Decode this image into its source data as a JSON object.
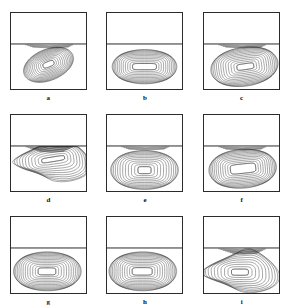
{
  "figure": {
    "type": "contour-panel-grid",
    "rows": 3,
    "columns": 3,
    "background_color": "#ffffff",
    "frame_color": "#2b2b2b",
    "contour_color": "#3a3a3a",
    "divider_fraction": 0.41
  },
  "chart_data": {
    "type": "contour",
    "title": "",
    "xlabel": "",
    "ylabel": "",
    "grid": false,
    "legend": null,
    "panel_geometry": {
      "frame": [
        0,
        0,
        1,
        1
      ],
      "divider_y": 0.41,
      "contour_region": [
        0,
        0.41,
        1,
        1
      ]
    },
    "panels": [
      {
        "label": "a",
        "description": "tilted elongated vortex, dense nested contours, core offset right-of-centre",
        "core": {
          "cx": 0.5,
          "cy": 0.67,
          "rx": 0.075,
          "ry": 0.035,
          "rotation": -22
        },
        "levels": 13,
        "outer": {
          "rx": 0.34,
          "ry": 0.2,
          "rotation": -22
        },
        "style": "tilted-ellipse"
      },
      {
        "label": "b",
        "description": "broad horizontal vortex filling lower cell, rounded-rectangle contours",
        "core": {
          "cx": 0.5,
          "cy": 0.7,
          "rx": 0.155,
          "ry": 0.04,
          "rotation": 0
        },
        "levels": 12,
        "outer": {
          "rx": 0.42,
          "ry": 0.22,
          "rotation": 0
        },
        "style": "rounded-rect"
      },
      {
        "label": "c",
        "description": "vortex with secondary roll along upper divider, contours skewed right",
        "core": {
          "cx": 0.55,
          "cy": 0.7,
          "rx": 0.11,
          "ry": 0.038,
          "rotation": -8
        },
        "levels": 13,
        "outer": {
          "rx": 0.44,
          "ry": 0.25,
          "rotation": -8
        },
        "style": "rounded-rect",
        "secondary": true
      },
      {
        "label": "d",
        "description": "complex multi-cell pattern, S-shaped wavy contours, dark shear band under divider",
        "core": {
          "cx": 0.56,
          "cy": 0.58,
          "rx": 0.15,
          "ry": 0.03,
          "rotation": -9
        },
        "levels": 11,
        "outer": {
          "rx": 0.44,
          "ry": 0.26,
          "rotation": 0
        },
        "style": "wavy"
      },
      {
        "label": "e",
        "description": "symmetric rectangular vortex, small round core near centre",
        "core": {
          "cx": 0.5,
          "cy": 0.72,
          "rx": 0.085,
          "ry": 0.045,
          "rotation": 0
        },
        "levels": 12,
        "outer": {
          "rx": 0.44,
          "ry": 0.25,
          "rotation": 0
        },
        "style": "rounded-rect"
      },
      {
        "label": "f",
        "description": "large open core, contours packed near left and bottom walls",
        "core": {
          "cx": 0.52,
          "cy": 0.7,
          "rx": 0.165,
          "ry": 0.06,
          "rotation": -6
        },
        "levels": 12,
        "outer": {
          "rx": 0.44,
          "ry": 0.25,
          "rotation": -4
        },
        "style": "rounded-rect"
      },
      {
        "label": "g",
        "description": "broad elliptical vortex, evenly spaced nested contours",
        "core": {
          "cx": 0.48,
          "cy": 0.71,
          "rx": 0.115,
          "ry": 0.045,
          "rotation": 0
        },
        "levels": 13,
        "outer": {
          "rx": 0.44,
          "ry": 0.25,
          "rotation": 0
        },
        "style": "rounded-rect"
      },
      {
        "label": "h",
        "description": "elongated vortex shifted slightly left, tight contour packing at right wall",
        "core": {
          "cx": 0.47,
          "cy": 0.71,
          "rx": 0.13,
          "ry": 0.048,
          "rotation": 0
        },
        "levels": 13,
        "outer": {
          "rx": 0.44,
          "ry": 0.25,
          "rotation": 0
        },
        "style": "rounded-rect"
      },
      {
        "label": "i",
        "description": "dark shear layer along divider, wavy inner contours with kinked core",
        "core": {
          "cx": 0.48,
          "cy": 0.72,
          "rx": 0.11,
          "ry": 0.04,
          "rotation": 0
        },
        "levels": 11,
        "outer": {
          "rx": 0.44,
          "ry": 0.26,
          "rotation": 0
        },
        "style": "wavy"
      }
    ]
  }
}
